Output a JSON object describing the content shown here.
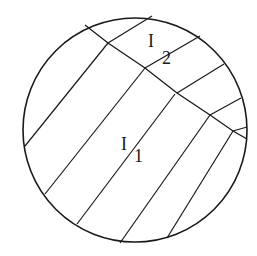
{
  "diagram": {
    "type": "grain-boundary-schematic",
    "stroke_color": "#1a1a1a",
    "background": "#ffffff",
    "circle": {
      "cx": 135,
      "cy": 130,
      "r": 112
    },
    "labels": [
      {
        "id": "I1",
        "main": "I",
        "sub": "1",
        "x": 121,
        "y": 150,
        "sub_x": 134,
        "sub_y": 162
      },
      {
        "id": "I2",
        "main": "I",
        "sub": "2",
        "x": 148,
        "y": 47,
        "sub_x": 162,
        "sub_y": 64
      }
    ],
    "interface_boundary": [
      [
        85,
        25
      ],
      [
        108,
        43
      ],
      [
        145,
        68
      ],
      [
        177,
        93
      ],
      [
        210,
        115
      ],
      [
        233,
        131
      ],
      [
        247,
        139
      ]
    ],
    "region_I1_lines": [
      [
        [
          25,
          146
        ],
        [
          108,
          43
        ]
      ],
      [
        [
          45,
          194
        ],
        [
          145,
          68
        ]
      ],
      [
        [
          77,
          224
        ],
        [
          175,
          94
        ]
      ],
      [
        [
          120,
          243
        ],
        [
          210,
          115
        ]
      ],
      [
        [
          167,
          238
        ],
        [
          233,
          131
        ]
      ]
    ],
    "region_I2_lines": [
      [
        [
          108,
          43
        ],
        [
          152,
          16
        ]
      ],
      [
        [
          145,
          68
        ],
        [
          200,
          36
        ]
      ],
      [
        [
          177,
          93
        ],
        [
          224,
          64
        ]
      ],
      [
        [
          210,
          115
        ],
        [
          241,
          98
        ]
      ],
      [
        [
          233,
          131
        ],
        [
          247,
          127
        ]
      ]
    ]
  }
}
